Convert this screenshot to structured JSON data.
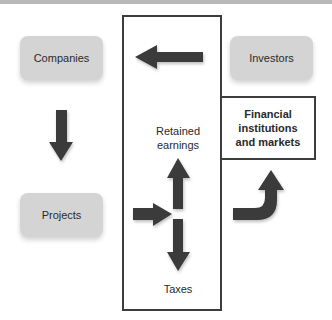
{
  "diagram": {
    "nodes": {
      "companies": "Companies",
      "investors": "Investors",
      "projects": "Projects",
      "financial_line1": "Financial",
      "financial_line2": "institutions",
      "financial_line3": "and markets"
    },
    "labels": {
      "retained_line1": "Retained",
      "retained_line2": "earnings",
      "taxes": "Taxes"
    },
    "arrows": [
      {
        "from": "Investors",
        "to": "Companies",
        "direction": "left"
      },
      {
        "from": "Companies",
        "to": "Projects",
        "direction": "down"
      },
      {
        "from": "Projects",
        "to": "split",
        "direction": "right"
      },
      {
        "from": "split",
        "to": "Retained earnings",
        "direction": "up"
      },
      {
        "from": "split",
        "to": "Taxes",
        "direction": "down"
      },
      {
        "from": "Projects",
        "to": "Financial institutions and markets",
        "direction": "curved-up"
      }
    ],
    "colors": {
      "node_fill": "#d4d4d4",
      "arrow": "#3a3a3a",
      "frame": "#3d3d3d"
    }
  }
}
